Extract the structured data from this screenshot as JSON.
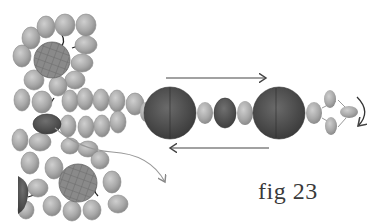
{
  "figure": {
    "caption": "fig 23",
    "arrows": [
      {
        "name": "top-arrow",
        "direction": "right"
      },
      {
        "name": "bottom-arrow",
        "direction": "left"
      },
      {
        "name": "curved-arrow-end",
        "direction": "clockwise-down"
      },
      {
        "name": "curved-arrow-cluster",
        "direction": "down-right"
      }
    ]
  },
  "colors": {
    "seed_bead": "#a9a9a9",
    "seed_bead_stroke": "#8a8a8a",
    "large_bead": "#4a4a4a",
    "dark_oval": "#555555",
    "crystal_bead": "#7a7a7a",
    "arrow": "#555555",
    "curve_line": "#999999"
  }
}
